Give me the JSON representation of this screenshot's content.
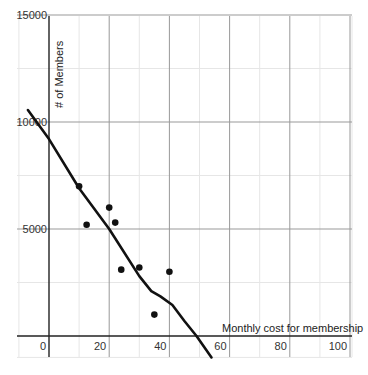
{
  "chart_data": {
    "type": "scatter",
    "title": "",
    "xlabel": "Monthly cost for membership",
    "ylabel": "# of Members",
    "xlim": [
      -10,
      100
    ],
    "ylim": [
      -1000,
      15000
    ],
    "grid": true,
    "x_ticks": [
      0,
      20,
      40,
      60,
      80,
      100
    ],
    "x_tick_labels": [
      "0",
      "20",
      "40",
      "60",
      "80",
      "100"
    ],
    "y_ticks": [
      5000,
      10000,
      15000
    ],
    "y_tick_labels": [
      "5000",
      "10000",
      "15000"
    ],
    "series": [
      {
        "name": "Data points",
        "type": "scatter",
        "x": [
          10,
          12.5,
          20,
          22,
          24,
          30,
          35,
          40
        ],
        "y": [
          7000,
          5200,
          6000,
          5300,
          3100,
          3200,
          1000,
          3000
        ]
      },
      {
        "name": "Trend curve",
        "type": "line",
        "x": [
          -7,
          0,
          10,
          20,
          30,
          34,
          37,
          41,
          45,
          49,
          54
        ],
        "y": [
          10560,
          9200,
          6900,
          5000,
          2800,
          2100,
          1850,
          1450,
          700,
          0,
          -1000
        ]
      }
    ],
    "legend": null
  },
  "colors": {
    "background": "#ffffff",
    "major_grid": "#999999",
    "minor_grid": "#e6e6e6",
    "axis": "#222222",
    "points": "#111111",
    "curve": "#111111"
  }
}
